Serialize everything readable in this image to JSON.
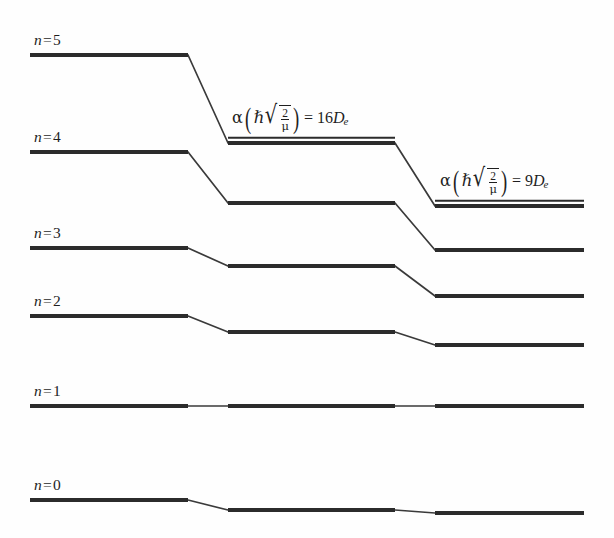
{
  "figure": {
    "background_color": "#fefefe",
    "line_color": "#2b2b2b",
    "width": 614,
    "height": 538
  },
  "level_labels": [
    {
      "name": "n-label-5",
      "var": "n",
      "eq": "=",
      "value": "5"
    },
    {
      "name": "n-label-4",
      "var": "n",
      "eq": "=",
      "value": "4"
    },
    {
      "name": "n-label-3",
      "var": "n",
      "eq": "=",
      "value": "3"
    },
    {
      "name": "n-label-2",
      "var": "n",
      "eq": "=",
      "value": "2"
    },
    {
      "name": "n-label-1",
      "var": "n",
      "eq": "=",
      "value": "1"
    },
    {
      "name": "n-label-0",
      "var": "n",
      "eq": "=",
      "value": "0"
    }
  ],
  "column_labels": {
    "middle": {
      "alpha": "α",
      "hbar": "ℏ",
      "radical": "√",
      "numerator": "2",
      "denominator": "μ",
      "equals": "=",
      "coefficient": "16",
      "depth_symbol": "D",
      "depth_subscript": "e",
      "plain_text": "α(ℏ√(2/μ)) = 16De"
    },
    "right": {
      "alpha": "α",
      "hbar": "ℏ",
      "radical": "√",
      "numerator": "2",
      "denominator": "μ",
      "equals": "=",
      "coefficient": "9",
      "depth_symbol": "D",
      "depth_subscript": "e",
      "plain_text": "α(ℏ√(2/μ)) = 9De"
    }
  },
  "chart_data": {
    "type": "line",
    "xlabel": "",
    "ylabel": "Energy",
    "grid": false,
    "legend": "none",
    "note": "Energy levels for three values of the Morse parameter; y in screen pixels (smaller y = higher energy).",
    "columns": [
      {
        "key": "harmonic",
        "label": "n = k (harmonic limit)",
        "x_start": 30,
        "x_end": 188
      },
      {
        "key": "morse16",
        "label": "α(ℏ√(2/μ)) = 16De",
        "x_start": 228,
        "x_end": 395
      },
      {
        "key": "morse9",
        "label": "α(ℏ√(2/μ)) = 9De",
        "x_start": 435,
        "x_end": 584
      }
    ],
    "levels": [
      {
        "n": 5,
        "harmonic_y": 55,
        "morse16_y": 143,
        "morse9_y": 206
      },
      {
        "n": 4,
        "harmonic_y": 152,
        "morse16_y": 203,
        "morse9_y": 250
      },
      {
        "n": 3,
        "harmonic_y": 248,
        "morse16_y": 266,
        "morse9_y": 296
      },
      {
        "n": 2,
        "harmonic_y": 316,
        "morse16_y": 332,
        "morse9_y": 345
      },
      {
        "n": 1,
        "harmonic_y": 406,
        "morse16_y": 406,
        "morse9_y": 406
      },
      {
        "n": 0,
        "harmonic_y": 500,
        "morse16_y": 510,
        "morse9_y": 513
      }
    ],
    "label_rules": [
      {
        "for": "morse16",
        "x1": 228,
        "x2": 395,
        "y": 143
      },
      {
        "for": "morse9",
        "x1": 435,
        "x2": 584,
        "y": 206
      }
    ]
  }
}
